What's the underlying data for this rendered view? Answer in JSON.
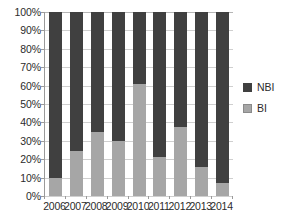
{
  "chart_data": {
    "type": "bar",
    "variant": "stacked-100-percent",
    "title": "",
    "subtitle": "",
    "xlabel": "",
    "ylabel": "",
    "categories": [
      "2006",
      "2007",
      "2008",
      "2009",
      "2010",
      "2011",
      "2012",
      "2013",
      "2014"
    ],
    "series": [
      {
        "name": "BI",
        "color": "#a6a6a6",
        "values": [
          10,
          24.5,
          35,
          30,
          61,
          21,
          37.5,
          16,
          7
        ]
      },
      {
        "name": "NBI",
        "color": "#404040",
        "values": [
          90,
          75.5,
          65,
          70,
          39,
          79,
          62.5,
          84,
          93
        ]
      }
    ],
    "ylim": [
      0,
      100
    ],
    "y_ticks": [
      0,
      10,
      20,
      30,
      40,
      50,
      60,
      70,
      80,
      90,
      100
    ],
    "y_tick_labels": [
      "0%",
      "10%",
      "20%",
      "30%",
      "40%",
      "50%",
      "60%",
      "70%",
      "80%",
      "90%",
      "100%"
    ],
    "grid": true,
    "grid_axis": "y",
    "legend_position": "right",
    "legend_entries": [
      {
        "label": "NBI",
        "color": "#404040",
        "swatch": "legend-swatch-nbi"
      },
      {
        "label": "BI",
        "color": "#a6a6a6",
        "swatch": "legend-swatch-bi"
      }
    ]
  },
  "colors": {
    "nbi": "#404040",
    "bi": "#a6a6a6",
    "gridline": "#cfcfcf",
    "axis": "#9a9a9a",
    "text": "#2b2b2b",
    "background": "#ffffff"
  }
}
